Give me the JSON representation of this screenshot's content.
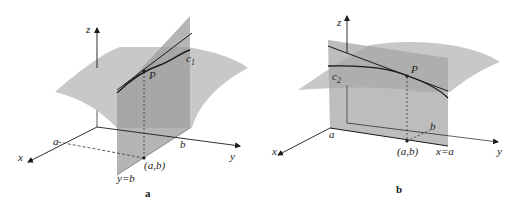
{
  "figure_a": {
    "caption": "a",
    "axes": {
      "x": "x",
      "y": "y",
      "z": "z"
    },
    "tick_labels": {
      "a": "a",
      "b": "b"
    },
    "point_label": "P",
    "curve_label": "c",
    "curve_subscript": "1",
    "base_point_label": "(a,b)",
    "plane_label": "y=b"
  },
  "figure_b": {
    "caption": "b",
    "axes": {
      "x": "x",
      "y": "y",
      "z": "z"
    },
    "tick_labels": {
      "a": "a",
      "b": "b"
    },
    "point_label": "P",
    "curve_label": "c",
    "curve_subscript": "2",
    "base_point_label": "(a,b)",
    "plane_label": "x=a"
  },
  "colors": {
    "surface": "#c4c4c4",
    "plane": "#a9a9a9",
    "lines": "#1a1a1a"
  }
}
